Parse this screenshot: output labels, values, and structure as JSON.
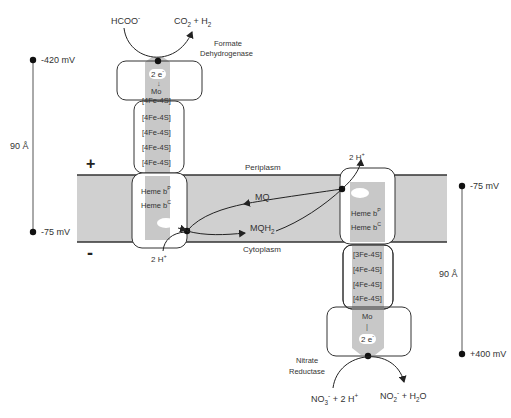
{
  "membrane": {
    "periplasm_label": "Periplasm",
    "cytoplasm_label": "Cytoplasm",
    "plus_sign": "+",
    "minus_sign": "-",
    "colors": {
      "membrane_fill": "#d0d0d0",
      "cofactor_column": "#c8c8c8",
      "outline": "#333333"
    }
  },
  "formate_dehydrogenase": {
    "name_line1": "Formate",
    "name_line2": "Dehydrogenase",
    "substrate": "HCOO",
    "substrate_charge": "-",
    "product_co2": "CO",
    "product_co2_sub": "2",
    "product_plus": " + H",
    "product_h2_sub": "2",
    "electrons": "2 e",
    "electrons_sup": "-",
    "cofactors": [
      "Mo",
      "[4Fe-4S]",
      "[4Fe-4S]",
      "[4Fe-4S]",
      "[4Fe-4S]",
      "[4Fe-4S]"
    ],
    "heme_p": "Heme b",
    "heme_p_sup": "P",
    "heme_c": "Heme b",
    "heme_c_sup": "C",
    "protons": "2 H",
    "protons_sup": "+"
  },
  "quinone_pool": {
    "mq": "MQ",
    "mqh2": "MQH",
    "mqh2_sub": "2"
  },
  "nitrate_reductase": {
    "name_line1": "Nitrate",
    "name_line2": "Reductase",
    "protons": "2 H",
    "protons_sup": "+",
    "heme_p": "Heme b",
    "heme_p_sup": "P",
    "heme_c": "Heme b",
    "heme_c_sup": "C",
    "cofactors": [
      "[3Fe-4S]",
      "[4Fe-4S]",
      "[4Fe-4S]",
      "[4Fe-4S]",
      "Mo"
    ],
    "electrons": "2 e",
    "electrons_sup": "-",
    "substrate_no3": "NO",
    "substrate_no3_sub": "3",
    "substrate_no3_sup": "-",
    "substrate_rest": " + 2 H",
    "substrate_rest_sup": "+",
    "product_no2": "NO",
    "product_no2_sub": "2",
    "product_no2_sup": "-",
    "product_rest": " +  H",
    "product_h2o_sub": "2",
    "product_o": "O"
  },
  "left_scale": {
    "top_potential": "-420 mV",
    "bottom_potential": "-75 mV",
    "distance": "90 Å"
  },
  "right_scale": {
    "top_potential": "-75 mV",
    "bottom_potential": "+400 mV",
    "distance": "90 Å"
  }
}
